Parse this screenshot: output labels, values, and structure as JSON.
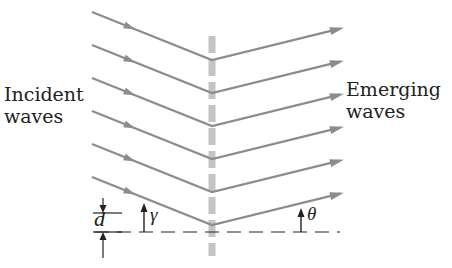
{
  "labels": {
    "incident": [
      "Incident",
      "waves"
    ],
    "emerging": [
      "Emerging",
      "waves"
    ],
    "d": "d",
    "gamma": "γ",
    "theta": "θ"
  },
  "colors": {
    "ray": "#8c8c8c",
    "grating": "#c4c4c4",
    "ink": "#222222"
  },
  "geometry": {
    "grating_x": 212,
    "vertex_y": [
      60,
      93,
      126,
      159,
      192,
      225
    ],
    "incident_start_x": 92,
    "emerging_end_x": 340
  }
}
